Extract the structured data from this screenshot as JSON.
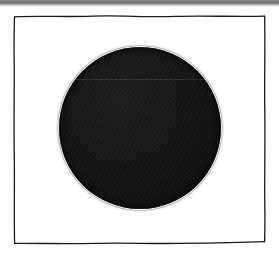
{
  "page": {
    "kind": "scanned-figure",
    "background_color": "#ffffff",
    "width": 279,
    "height": 256
  },
  "scanner_band": {
    "name": "scanner-edge-band",
    "color": "#7a7a7a",
    "position": "top",
    "height": 5
  },
  "frame": {
    "name": "hand-drawn-square-border",
    "stroke_color": "#1a1a1a",
    "stroke_width": 1.3,
    "style": "hand-drawn wavy ink line",
    "left": 14,
    "top": 16,
    "right": 265,
    "bottom": 243,
    "fill_color": "#ffffff"
  },
  "figure": {
    "name": "solid-black-circle",
    "shape": "circle",
    "fill_color": "#101010",
    "center_x": 140,
    "center_y": 128,
    "radius": 81,
    "texture": "printed ink grain"
  },
  "artifacts": {
    "scan_seam": {
      "name": "horizontal-scan-seam",
      "y": 79,
      "color": "#ffffff",
      "opacity": 0.1
    }
  },
  "caption": ""
}
